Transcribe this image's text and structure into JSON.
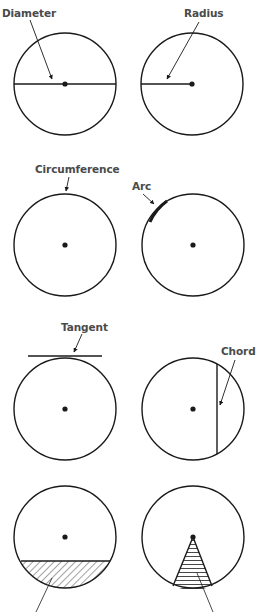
{
  "colors": {
    "stroke": "#1a1a1a",
    "label": "#4a4a4a",
    "hatch": "#333333",
    "background": "#ffffff"
  },
  "labels": {
    "diameter": "Diameter",
    "radius": "Radius",
    "circumference": "Circumference",
    "arc": "Arc",
    "tangent": "Tangent",
    "chord": "Chord"
  },
  "panels": [
    {
      "name": "diameter",
      "label": "Diameter",
      "center": [
        65,
        84
      ],
      "r": 51
    },
    {
      "name": "radius",
      "label": "Radius",
      "center": [
        192,
        84
      ],
      "r": 51
    },
    {
      "name": "circumference",
      "label": "Circumference",
      "center": [
        65,
        245
      ],
      "r": 51
    },
    {
      "name": "arc",
      "label": "Arc",
      "center": [
        193,
        245
      ],
      "r": 51
    },
    {
      "name": "tangent",
      "label": "Tangent",
      "center": [
        65,
        409
      ],
      "r": 51
    },
    {
      "name": "chord",
      "label": "Chord",
      "center": [
        193,
        409
      ],
      "r": 51
    },
    {
      "name": "segment",
      "label": "",
      "center": [
        65,
        537
      ],
      "r": 51
    },
    {
      "name": "sector",
      "label": "",
      "center": [
        193,
        537
      ],
      "r": 51
    }
  ]
}
